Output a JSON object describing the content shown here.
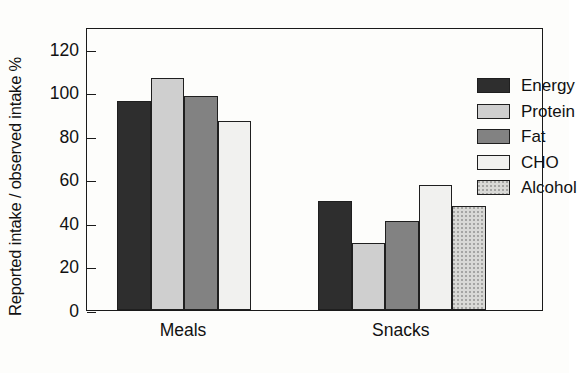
{
  "chart_data": {
    "type": "bar",
    "title": "",
    "xlabel": "",
    "ylabel": "Reported intake / observed intake %",
    "categories": [
      "Meals",
      "Snacks"
    ],
    "ylim": [
      0,
      130
    ],
    "yticks": [
      0,
      20,
      40,
      60,
      80,
      100,
      120
    ],
    "ytick_labels": [
      "0",
      "20",
      "40",
      "60",
      "80",
      "100",
      "120"
    ],
    "grid": false,
    "legend_position": "top-right-inside",
    "series": [
      {
        "name": "Energy",
        "color": "#2e2e2e",
        "values": [
          96,
          50
        ]
      },
      {
        "name": "Protein",
        "color": "#cfcfcf",
        "values": [
          106.5,
          31
        ]
      },
      {
        "name": "Fat",
        "color": "#828282",
        "values": [
          98.5,
          41
        ]
      },
      {
        "name": "CHO",
        "color": "#f1f1ef",
        "values": [
          87,
          57.5
        ]
      },
      {
        "name": "Alcohol",
        "color": "#d9d9d6",
        "values": [
          null,
          48
        ]
      }
    ]
  },
  "axis": {
    "y_title": "Reported intake / observed intake %"
  },
  "legend": {
    "items": [
      {
        "label": "Energy",
        "swatch": "fill-energy"
      },
      {
        "label": "Protein",
        "swatch": "fill-protein"
      },
      {
        "label": "Fat",
        "swatch": "fill-fat"
      },
      {
        "label": "CHO",
        "swatch": "fill-cho"
      },
      {
        "label": "Alcohol",
        "swatch": "fill-alcohol"
      }
    ]
  }
}
